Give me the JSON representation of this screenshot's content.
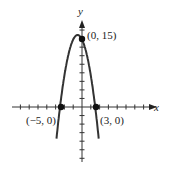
{
  "chart_data": {
    "type": "line",
    "title": "",
    "function": "y = -x^2 - 2x + 15",
    "xlabel": "x",
    "ylabel": "y",
    "xlim": [
      -9,
      9
    ],
    "ylim": [
      -13,
      20
    ],
    "grid": false,
    "x": [
      -5.6,
      -5,
      -4,
      -3,
      -2,
      -1,
      0,
      1,
      2,
      3,
      3.6
    ],
    "values": [
      -3.96,
      0,
      7,
      12,
      15,
      16,
      15,
      12,
      7,
      0,
      -3.96
    ],
    "points": [
      {
        "x": 0,
        "y": 15,
        "label": "(0, 15)"
      },
      {
        "x": -5,
        "y": 0,
        "label": "(−5, 0)"
      },
      {
        "x": 3,
        "y": 0,
        "label": "(3, 0)"
      }
    ]
  },
  "labels": {
    "x_axis": "x",
    "y_axis": "y",
    "p_top": "(0, 15)",
    "p_left": "(−5, 0)",
    "p_right": "(3, 0)"
  }
}
